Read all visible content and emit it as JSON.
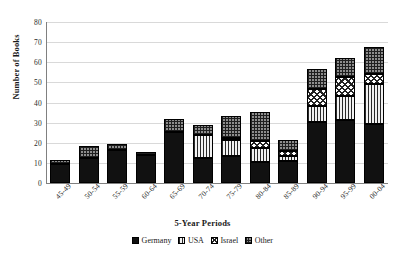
{
  "chart_data": {
    "type": "bar",
    "stacked": true,
    "title": "",
    "xlabel": "5-Year Periods",
    "ylabel": "Number of Books",
    "ylim": [
      0,
      80
    ],
    "ytick_step": 10,
    "yticks": [
      "80",
      "70",
      "60",
      "50",
      "40",
      "30",
      "20",
      "10",
      "0"
    ],
    "grid": true,
    "grid_axis": "y",
    "legend_position": "bottom",
    "categories": [
      "45-49",
      "50-54",
      "55-59",
      "60-64",
      "65-69",
      "70-74",
      "75-79",
      "80-84",
      "85-89",
      "90-94",
      "95-99",
      "00-04"
    ],
    "series": [
      {
        "name": "Germany",
        "pattern": "solid-black",
        "color": "#111111",
        "values": [
          9.5,
          12.5,
          16.5,
          14,
          25.5,
          12.5,
          13.5,
          10.5,
          11,
          30.5,
          31.5,
          29.5
        ]
      },
      {
        "name": "USA",
        "pattern": "vertical-stripes",
        "color": "#e8e8e8",
        "values": [
          0,
          0,
          0,
          0,
          0,
          11.5,
          8,
          7,
          2.5,
          8,
          11.5,
          19.5
        ]
      },
      {
        "name": "Israel",
        "pattern": "checkerboard",
        "color": "#ffffff",
        "values": [
          0,
          0,
          0,
          0,
          0,
          0,
          1,
          3.5,
          2.5,
          8,
          9.5,
          5
        ]
      },
      {
        "name": "Other",
        "pattern": "grid-hatch",
        "color": "#8d8d8d",
        "values": [
          2,
          6,
          3,
          1.5,
          6.5,
          5,
          11,
          14.5,
          5.5,
          10,
          9.5,
          13.5
        ]
      }
    ],
    "totals": [
      11.5,
      18.5,
      19.5,
      15.5,
      32,
      29,
      33.5,
      35.5,
      21.5,
      56.5,
      62,
      67.5
    ]
  },
  "legend": {
    "items": [
      {
        "label": "Germany"
      },
      {
        "label": "USA"
      },
      {
        "label": "Israel"
      },
      {
        "label": "Other"
      }
    ]
  }
}
